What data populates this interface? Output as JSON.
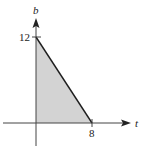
{
  "diagram": {
    "type": "region",
    "axes": {
      "x_label": "t",
      "y_label": "b"
    },
    "ticks": {
      "x": [
        {
          "value": 8,
          "label": "8"
        }
      ],
      "y": [
        {
          "value": 12,
          "label": "12"
        }
      ]
    },
    "vertices": [
      [
        0,
        0
      ],
      [
        8,
        0
      ],
      [
        0,
        12
      ]
    ],
    "boundary_line": {
      "from": [
        0,
        12
      ],
      "to": [
        8,
        0
      ]
    },
    "colors": {
      "fill": "#d3d3d3",
      "line": "#1e1e1e",
      "axis": "#333333"
    }
  }
}
